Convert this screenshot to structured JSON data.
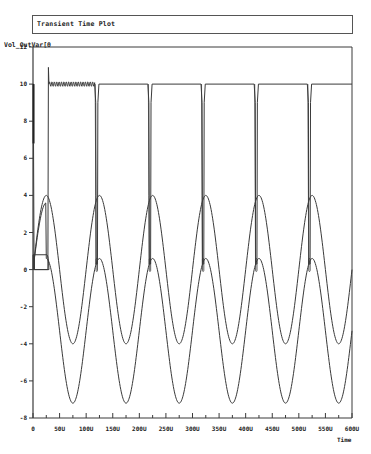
{
  "window": {
    "title": "Transient Time Plot"
  },
  "chart_data": {
    "type": "line",
    "title": "Transient Time Plot",
    "xlabel": "Time",
    "ylabel": "Vol_OutVar[0",
    "xlim": [
      0,
      600
    ],
    "ylim": [
      -8,
      12
    ],
    "x_unit": "U",
    "grid": false,
    "legend": "none",
    "x_ticks": [
      0,
      50,
      100,
      150,
      200,
      250,
      300,
      350,
      400,
      450,
      500,
      550,
      600
    ],
    "x_tick_labels": [
      "0",
      "50U",
      "100U",
      "150U",
      "200U",
      "250U",
      "300U",
      "350U",
      "400U",
      "450U",
      "500U",
      "550U",
      "600U"
    ],
    "y_ticks": [
      -8,
      -6,
      -4,
      -2,
      0,
      2,
      4,
      6,
      8,
      10,
      12
    ],
    "y_tick_labels": [
      "-8",
      "-6",
      "-4",
      "-2",
      "0",
      "2",
      "4",
      "6",
      "8",
      "10",
      "12"
    ],
    "series": [
      {
        "name": "pulse_output",
        "description": "Square-ish output at ~10V with narrow dips to ~0.3V every 100U; initial spike to ~10.9V near 30U and ringing ripple between 30U and 120U",
        "high_level": 10,
        "low_level": 0.3,
        "spike": {
          "x": 30,
          "y": 10.9
        },
        "dip_centers": [
          120,
          220,
          320,
          420,
          520
        ],
        "dip_width": 8,
        "points": [
          [
            0,
            0
          ],
          [
            0,
            10
          ],
          [
            1,
            10
          ],
          [
            1,
            6.8
          ],
          [
            2,
            0
          ],
          [
            28,
            0
          ],
          [
            29,
            10.9
          ],
          [
            30,
            10
          ],
          [
            120,
            10
          ],
          [
            123,
            0.3
          ],
          [
            127,
            0.3
          ],
          [
            130,
            10
          ],
          [
            220,
            10
          ],
          [
            223,
            0.3
          ],
          [
            227,
            0.3
          ],
          [
            230,
            10
          ],
          [
            320,
            10
          ],
          [
            323,
            0.3
          ],
          [
            327,
            0.3
          ],
          [
            330,
            10
          ],
          [
            420,
            10
          ],
          [
            423,
            0.3
          ],
          [
            427,
            0.3
          ],
          [
            430,
            10
          ],
          [
            520,
            10
          ],
          [
            523,
            0.3
          ],
          [
            527,
            0.3
          ],
          [
            530,
            10
          ],
          [
            600,
            10
          ]
        ]
      },
      {
        "name": "sine_upper",
        "description": "Sinusoid period 100U, peak +4 at 25U+n*100U, trough -4",
        "amplitude": 4,
        "offset": 0,
        "period": 100,
        "peak_x": [
          25,
          125,
          225,
          325,
          425,
          525
        ],
        "peak_y": 4,
        "trough_x": [
          75,
          175,
          275,
          375,
          475,
          575
        ],
        "trough_y": -4
      },
      {
        "name": "sine_lower",
        "description": "Sinusoid period 100U, peak ~0.6 at 125U+n*100U, trough ~-7.2",
        "amplitude": 3.9,
        "offset": -3.3,
        "period": 100,
        "peak_x": [
          25,
          125,
          225,
          325,
          425,
          525
        ],
        "peak_y": 0.6,
        "trough_x": [
          75,
          175,
          275,
          375,
          475,
          575
        ],
        "trough_y": -7.2
      },
      {
        "name": "startup_box",
        "description": "Small rectangular step 0 to ~0.8V between 0U and 30U",
        "points": [
          [
            0,
            0
          ],
          [
            0,
            0.8
          ],
          [
            28,
            0.8
          ],
          [
            30,
            0
          ],
          [
            0,
            0
          ]
        ]
      }
    ]
  }
}
